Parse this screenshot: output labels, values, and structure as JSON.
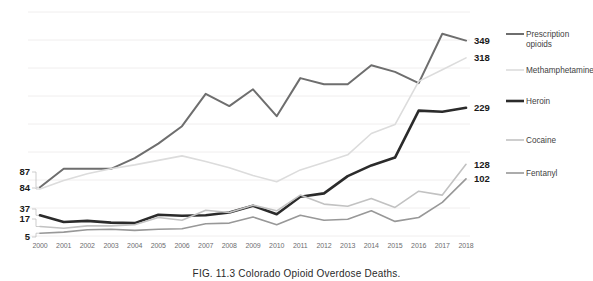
{
  "caption": "FIG. 11.3  Colorado Opioid Overdose Deaths.",
  "legend": {
    "items": [
      {
        "label": "Prescription opioids",
        "color": "#6e6e6e",
        "width": 2.0
      },
      {
        "label": "Methamphetamine",
        "color": "#dcdcdc",
        "width": 1.6
      },
      {
        "label": "Heroin",
        "color": "#2b2b2b",
        "width": 2.6
      },
      {
        "label": "Cocaine",
        "color": "#c2c2c2",
        "width": 1.6
      },
      {
        "label": "Fentanyl",
        "color": "#989898",
        "width": 1.6
      }
    ]
  },
  "start_labels": [
    {
      "value": "87",
      "series": "Prescription opioids"
    },
    {
      "value": "84",
      "series": "Methamphetamine"
    },
    {
      "value": "37",
      "series": "Heroin"
    },
    {
      "value": "17",
      "series": "Cocaine"
    },
    {
      "value": "5",
      "series": "Fentanyl"
    }
  ],
  "end_labels": [
    {
      "value": "349",
      "series": "Prescription opioids"
    },
    {
      "value": "318",
      "series": "Methamphetamine"
    },
    {
      "value": "229",
      "series": "Heroin"
    },
    {
      "value": "128",
      "series": "Cocaine"
    },
    {
      "value": "102",
      "series": "Fentanyl"
    }
  ],
  "chart_data": {
    "type": "line",
    "title": "FIG. 11.3  Colorado Opioid Overdose Deaths.",
    "xlabel": "",
    "ylabel": "",
    "grid": true,
    "legend_position": "right",
    "xlim": [
      2000,
      2018
    ],
    "ylim": [
      0,
      400
    ],
    "categories": [
      2000,
      2001,
      2002,
      2003,
      2004,
      2005,
      2006,
      2007,
      2008,
      2009,
      2010,
      2011,
      2012,
      2013,
      2014,
      2015,
      2016,
      2017,
      2018
    ],
    "xtick_labels": [
      "2000",
      "2001",
      "2002",
      "2003",
      "2004",
      "2005",
      "2006",
      "2007",
      "2008",
      "2009",
      "2010",
      "2011",
      "2012",
      "2013",
      "2014",
      "2015",
      "2016",
      "2017",
      "2018"
    ],
    "ytick_labels": [
      "87",
      "84",
      "37",
      "17",
      "5"
    ],
    "series": [
      {
        "name": "Prescription opioids",
        "color": "#6e6e6e",
        "width": 2.0,
        "start_value": 87,
        "end_value": 349,
        "values": [
          87,
          120,
          120,
          120,
          139,
          165,
          196,
          254,
          232,
          262,
          214,
          282,
          271,
          271,
          305,
          293,
          273,
          361,
          349
        ]
      },
      {
        "name": "Methamphetamine",
        "color": "#dcdcdc",
        "width": 1.6,
        "start_value": 84,
        "end_value": 318,
        "values": [
          84,
          99,
          111,
          120,
          127,
          135,
          143,
          133,
          122,
          108,
          97,
          118,
          131,
          145,
          183,
          199,
          276,
          297,
          318
        ]
      },
      {
        "name": "Heroin",
        "color": "#2b2b2b",
        "width": 2.6,
        "start_value": 37,
        "end_value": 229,
        "values": [
          37,
          25,
          27,
          24,
          23,
          38,
          36,
          37,
          42,
          54,
          39,
          70,
          76,
          107,
          126,
          140,
          224,
          222,
          229
        ]
      },
      {
        "name": "Cocaine",
        "color": "#c2c2c2",
        "width": 1.6,
        "start_value": 17,
        "end_value": 128,
        "values": [
          17,
          14,
          18,
          18,
          20,
          33,
          28,
          46,
          42,
          55,
          45,
          73,
          57,
          53,
          67,
          51,
          80,
          73,
          128
        ]
      },
      {
        "name": "Fentanyl",
        "color": "#989898",
        "width": 1.6,
        "start_value": 5,
        "end_value": 102,
        "values": [
          5,
          7,
          11,
          12,
          10,
          12,
          13,
          22,
          23,
          34,
          20,
          37,
          28,
          30,
          45,
          26,
          33,
          60,
          102
        ]
      }
    ]
  }
}
